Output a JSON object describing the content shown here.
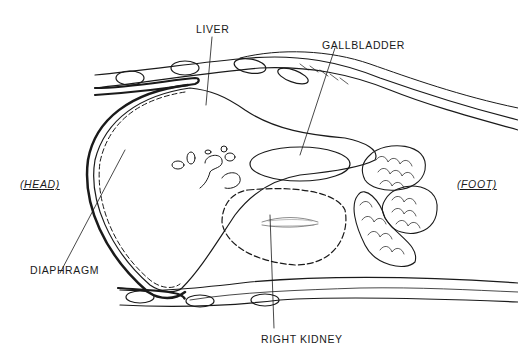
{
  "diagram": {
    "type": "anatomical sagittal section",
    "labels": {
      "liver": "LIVER",
      "gallbladder": "GALLBLADDER",
      "head": "(HEAD)",
      "foot": "(FOOT)",
      "diaphragm": "DIAPHRAGM",
      "right_kidney": "RIGHT KIDNEY"
    },
    "colors": {
      "ink": "#1a1a1a",
      "background": "#ffffff"
    }
  }
}
